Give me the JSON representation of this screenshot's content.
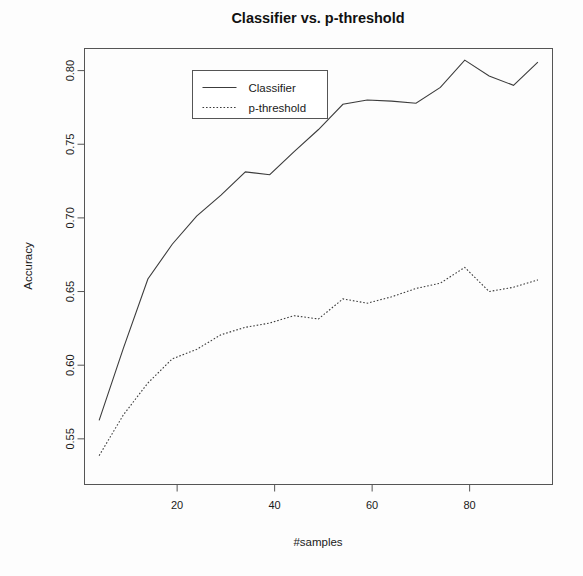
{
  "chart_data": {
    "type": "line",
    "title": "Classifier vs. p-threshold",
    "xlabel": "#samples",
    "ylabel": "Accuracy",
    "xlim": [
      1,
      97
    ],
    "ylim": [
      0.519,
      0.815
    ],
    "grid": false,
    "legend_position": "top-left-inside",
    "xticks": [
      20,
      40,
      60,
      80
    ],
    "xtick_labels": [
      "20",
      "40",
      "60",
      "80"
    ],
    "yticks": [
      0.55,
      0.6,
      0.65,
      0.7,
      0.75,
      0.8
    ],
    "ytick_labels": [
      "0.55",
      "0.60",
      "0.65",
      "0.70",
      "0.75",
      "0.80"
    ],
    "x": [
      4,
      9,
      14,
      19,
      24,
      29,
      34,
      39,
      44,
      49,
      54,
      59,
      64,
      69,
      74,
      79,
      84,
      89,
      94
    ],
    "series": [
      {
        "name": "Classifier",
        "style": "solid",
        "color": "#3c3c3c",
        "values": [
          0.5625,
          0.6118,
          0.6585,
          0.6821,
          0.7012,
          0.7155,
          0.7312,
          0.7293,
          0.745,
          0.76,
          0.7771,
          0.78,
          0.7793,
          0.7778,
          0.7886,
          0.8071,
          0.7964,
          0.79,
          0.8057
        ]
      },
      {
        "name": "p-threshold",
        "style": "dotted",
        "color": "#3c3c3c",
        "values": [
          0.5386,
          0.5664,
          0.5879,
          0.6043,
          0.6107,
          0.6207,
          0.6257,
          0.6286,
          0.6336,
          0.6314,
          0.645,
          0.6421,
          0.6464,
          0.6521,
          0.6557,
          0.6664,
          0.65,
          0.6529,
          0.6579
        ]
      }
    ]
  },
  "legend": {
    "entries": [
      {
        "label": "Classifier",
        "style": "solid"
      },
      {
        "label": "p-threshold",
        "style": "dotted"
      }
    ]
  }
}
